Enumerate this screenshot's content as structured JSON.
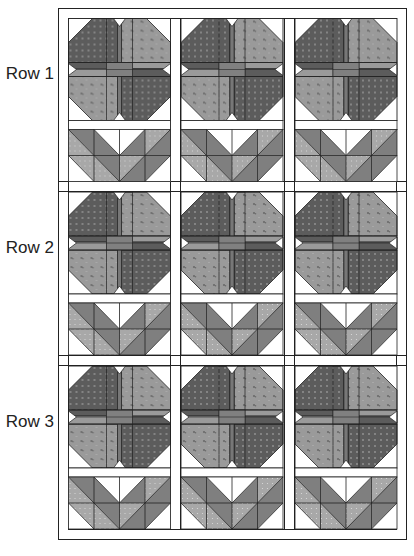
{
  "diagram": {
    "type": "quilt-layout",
    "rows": [
      {
        "label": "Row 1",
        "blocks": 3
      },
      {
        "label": "Row 2",
        "blocks": 3
      },
      {
        "label": "Row 3",
        "blocks": 3
      }
    ],
    "block": {
      "top": "flower (four-patch petals with center cross and notches)",
      "bottom": "leaves (2x4 half-square triangles)"
    },
    "colors": {
      "dark_fabric": "#5c5c5c",
      "light_fabric": "#9a9a9a",
      "leaf_medium": "#7f7f7f",
      "leaf_dotted": "#a8a8a8",
      "background": "#ffffff",
      "line": "#222222"
    }
  }
}
